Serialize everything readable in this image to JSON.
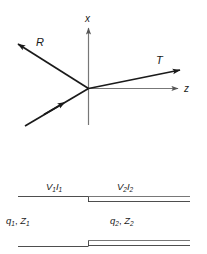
{
  "figure": {
    "background_color": "#ffffff",
    "ray_color": "#1a1a1a",
    "axis_color": "#777777",
    "guide_color": "#3a3a3a"
  },
  "axes": {
    "vertical": {
      "label": "x",
      "direction": "up"
    },
    "horizontal": {
      "label": "z",
      "direction": "right"
    }
  },
  "rays": {
    "incident": {
      "label": "",
      "arrow": "midpoint",
      "direction": "up-right"
    },
    "reflected": {
      "label": "R",
      "arrow": "tip",
      "direction": "up-left"
    },
    "transmitted": {
      "label": "T",
      "arrow": "tip",
      "direction": "up-right"
    }
  },
  "waveguide": {
    "region1": {
      "voltage_current": {
        "v": "V",
        "v_sub": "1",
        "i": "I",
        "i_sub": "1"
      },
      "params": {
        "q": "q",
        "q_sub": "1",
        "sep": ", ",
        "z": "Z",
        "z_sub": "1"
      }
    },
    "region2": {
      "voltage_current": {
        "v": "V",
        "v_sub": "2",
        "i": "I",
        "i_sub": "2"
      },
      "params": {
        "q": "q",
        "q_sub": "2",
        "sep": ", ",
        "z": "Z",
        "z_sub": "2"
      }
    }
  }
}
